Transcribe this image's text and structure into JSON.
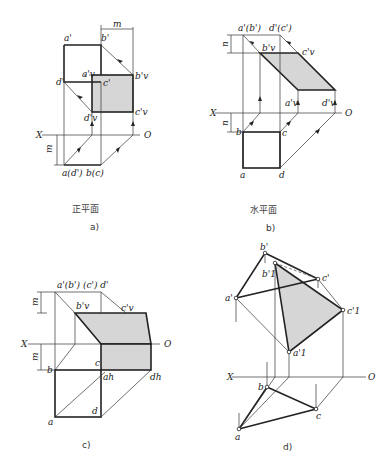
{
  "figure": {
    "panels": [
      {
        "id": "a",
        "caption": "a)",
        "subtitle": "正平面",
        "axis": {
          "x_label": "X",
          "o_label": "O"
        },
        "dimensions": [
          "m",
          "m"
        ],
        "labels": {
          "a_prime": "a'",
          "b_prime": "b'",
          "c_prime": "c'",
          "d_prime": "d'",
          "av_prime": "a'v",
          "bv_prime": "b'v",
          "cv_prime": "c'v",
          "dv_prime": "d'v",
          "a_d": "a(d')",
          "b_c": "b(c)"
        }
      },
      {
        "id": "b",
        "caption": "b)",
        "subtitle": "水平面",
        "axis": {
          "x_label": "X",
          "o_label": "O"
        },
        "dimensions": [
          "n",
          "n"
        ],
        "labels": {
          "ab_prime": "a'(b')",
          "dc_prime": "d'(c')",
          "bv_prime": "b'v",
          "cv_prime": "c'v",
          "av_prime": "a'v",
          "dv_prime": "d'v",
          "a": "a",
          "b": "b",
          "c": "c",
          "d": "d"
        }
      },
      {
        "id": "c",
        "caption": "c)",
        "axis": {
          "x_label": "X",
          "o_label": "O"
        },
        "dimensions": [
          "m",
          "m"
        ],
        "labels": {
          "top": "a'(b') (c') d'",
          "bv_prime": "b'v",
          "cv_prime": "c'v",
          "a": "a",
          "b": "b",
          "c": "c",
          "d": "d",
          "ah": "ah",
          "dh": "dh"
        }
      },
      {
        "id": "d",
        "caption": "d)",
        "axis": {
          "x_label": "X",
          "o_label": "O"
        },
        "labels": {
          "a_prime": "a'",
          "b_prime": "b'",
          "c_prime": "c'",
          "b1_prime": "b'1",
          "c1_prime": "c'1",
          "a1_prime": "a'1",
          "a": "a",
          "b": "b",
          "c": "c"
        }
      }
    ]
  }
}
